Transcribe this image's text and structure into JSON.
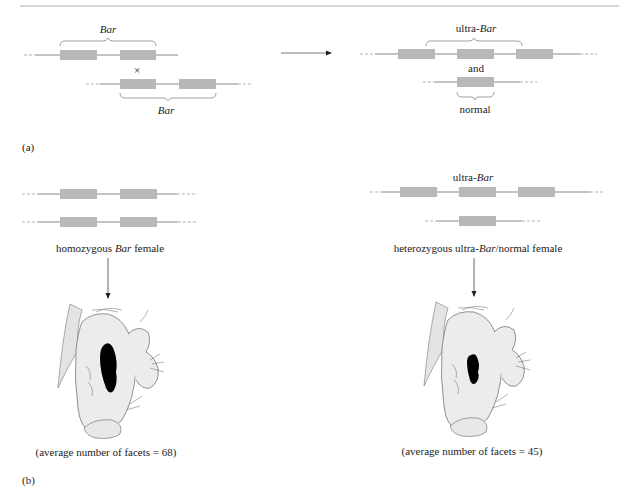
{
  "figure": {
    "colors": {
      "gene_box": "#b8b8b8",
      "chromosome_line": "#7a7a7a",
      "rule": "#b0b0b0",
      "eye": "#000000",
      "head_fill": "#ececec",
      "outline": "#555555"
    },
    "panel_a": {
      "label": "(a)",
      "parent_top": {
        "label": "Bar",
        "label_style": "italic",
        "segments": 2
      },
      "cross_symbol": "×",
      "parent_bottom": {
        "label": "Bar",
        "label_style": "italic",
        "segments": 2
      },
      "arrow": "right-arrow",
      "product_top": {
        "label_prefix": "ultra-",
        "label_italic": "Bar",
        "segments": 3
      },
      "conjunction": "and",
      "product_bottom": {
        "label": "normal",
        "segments": 1
      }
    },
    "panel_b": {
      "label": "(b)",
      "left": {
        "chromosomes": [
          {
            "segments": 2
          },
          {
            "segments": 2
          }
        ],
        "caption_pre": "homozygous ",
        "caption_italic": "Bar",
        "caption_post": " female",
        "result": "(average number of facets = 68)",
        "facets": 68
      },
      "right": {
        "chromosome_label_prefix": "ultra-",
        "chromosome_label_italic": "Bar",
        "chromosomes": [
          {
            "segments": 3
          },
          {
            "segments": 1
          }
        ],
        "caption_pre": "heterozygous ultra-",
        "caption_italic": "Bar",
        "caption_post": "/normal female",
        "result": "(average number of facets = 45)",
        "facets": 45
      }
    }
  }
}
